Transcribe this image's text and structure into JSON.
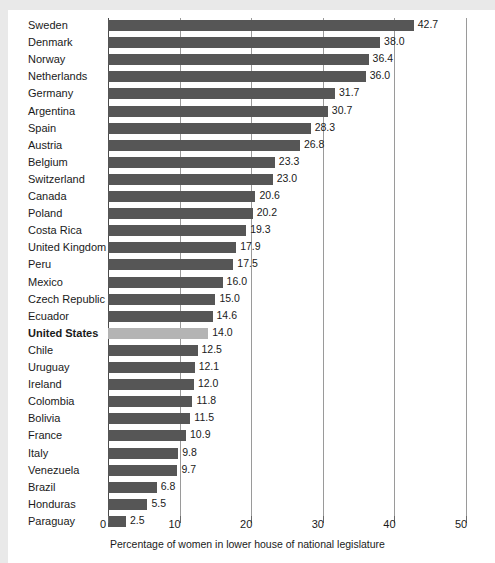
{
  "chart_data": {
    "type": "bar",
    "orientation": "horizontal",
    "title": "",
    "xlabel": "Percentage of women in lower house of national legislature",
    "ylabel": "",
    "xlim": [
      0,
      50
    ],
    "xticks": [
      0,
      10,
      20,
      30,
      40,
      50
    ],
    "xtick_labels": [
      "0",
      "10",
      "20",
      "30",
      "40",
      "50"
    ],
    "grid": true,
    "legend": "none",
    "highlight_category": "United States",
    "colors": {
      "bar": "#565656",
      "highlight_bar": "#b4b4b4",
      "gridline": "#9a9a9a",
      "axis": "#4a4a4a",
      "text": "#1a1a1a",
      "background": "#ffffff",
      "page": "#e9e9e9"
    },
    "categories": [
      "Sweden",
      "Denmark",
      "Norway",
      "Netherlands",
      "Germany",
      "Argentina",
      "Spain",
      "Austria",
      "Belgium",
      "Switzerland",
      "Canada",
      "Poland",
      "Costa Rica",
      "United Kingdom",
      "Peru",
      "Mexico",
      "Czech Republic",
      "Ecuador",
      "United States",
      "Chile",
      "Uruguay",
      "Ireland",
      "Colombia",
      "Bolivia",
      "France",
      "Italy",
      "Venezuela",
      "Brazil",
      "Honduras",
      "Paraguay"
    ],
    "values": [
      42.7,
      38.0,
      36.4,
      36.0,
      31.7,
      30.7,
      28.3,
      26.8,
      23.3,
      23.0,
      20.6,
      20.2,
      19.3,
      17.9,
      17.5,
      16.0,
      15.0,
      14.6,
      14.0,
      12.5,
      12.1,
      12.0,
      11.8,
      11.5,
      10.9,
      9.8,
      9.7,
      6.8,
      5.5,
      2.5
    ],
    "value_labels": [
      "42.7",
      "38.0",
      "36.4",
      "36.0",
      "31.7",
      "30.7",
      "28.3",
      "26.8",
      "23.3",
      "23.0",
      "20.6",
      "20.2",
      "19.3",
      "17.9",
      "17.5",
      "16.0",
      "15.0",
      "14.6",
      "14.0",
      "12.5",
      "12.1",
      "12.0",
      "11.8",
      "11.5",
      "10.9",
      "9.8",
      "9.7",
      "6.8",
      "5.5",
      "2.5"
    ]
  }
}
